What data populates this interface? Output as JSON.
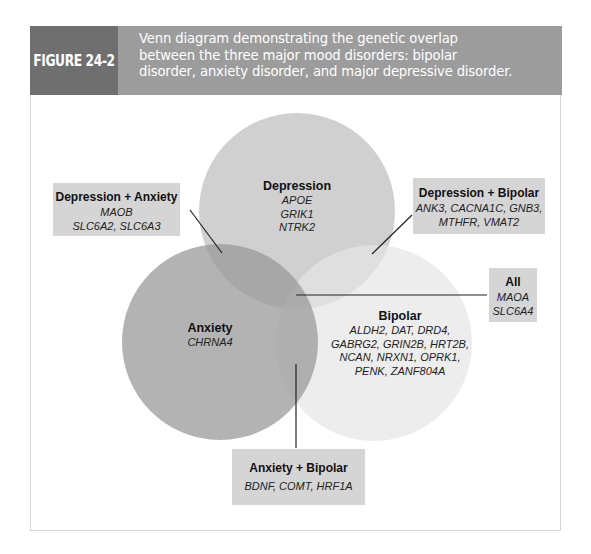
{
  "figure": {
    "label": "FIGURE 24-2",
    "caption_lines": [
      "Venn diagram demonstrating the genetic overlap",
      "between the three major mood disorders: bipolar",
      "disorder, anxiety disorder, and major depressive disorder."
    ]
  },
  "colors": {
    "header_label_bg": "#6f6f6f",
    "header_caption_bg": "#9c9c9c",
    "depression_circle": "#c8c8c8",
    "anxiety_circle": "#a9a9a9",
    "bipolar_circle": "#ececec",
    "label_box_bg": "#d5d5d5"
  },
  "sets": {
    "depression": {
      "title": "Depression",
      "genes": [
        "APOE",
        "GRIK1",
        "NTRK2"
      ]
    },
    "anxiety": {
      "title": "Anxiety",
      "genes": [
        "CHRNA4"
      ]
    },
    "bipolar": {
      "title": "Bipolar",
      "gene_lines": [
        "ALDH2, DAT, DRD4,",
        "GABRG2, GRIN2B, HRT2B,",
        "NCAN, NRXN1, OPRK1,",
        "PENK, ZANF804A"
      ]
    }
  },
  "overlaps": {
    "depression_anxiety": {
      "title": "Depression + Anxiety",
      "gene_lines": [
        "MAOB",
        "SLC6A2, SLC6A3"
      ]
    },
    "depression_bipolar": {
      "title": "Depression + Bipolar",
      "gene_lines": [
        "ANK3, CACNA1C, GNB3,",
        "MTHFR, VMAT2"
      ]
    },
    "all": {
      "title": "All",
      "gene_lines": [
        "MAOA",
        "SLC6A4"
      ]
    },
    "anxiety_bipolar": {
      "title": "Anxiety + Bipolar",
      "gene_lines": [
        "BDNF, COMT, HRF1A"
      ]
    }
  }
}
